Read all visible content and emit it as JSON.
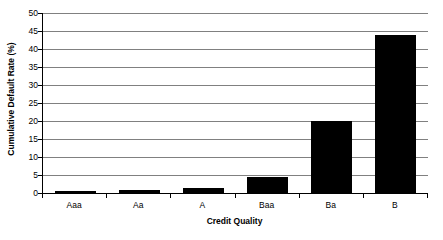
{
  "chart_data": {
    "type": "bar",
    "title": "",
    "categories": [
      "Aaa",
      "Aa",
      "A",
      "Baa",
      "Ba",
      "B"
    ],
    "values": [
      0.5,
      0.8,
      1.3,
      4.5,
      20.0,
      43.8
    ],
    "xlabel": "Credit Quality",
    "ylabel": "Cumulative Default Rate (%)",
    "ylim": [
      0,
      50
    ],
    "ytick_step": 5,
    "yticks": [
      0,
      5,
      10,
      15,
      20,
      25,
      30,
      35,
      40,
      45,
      50
    ],
    "ytick_labels": [
      "0",
      "5",
      "10",
      "15",
      "20",
      "25",
      "30",
      "35",
      "40",
      "45",
      "50"
    ],
    "grid": true,
    "grid_axis": "y",
    "legend": false,
    "legend_position": "none",
    "bar_color": "#000000",
    "grid_color": "#808080",
    "background_color": "#ffffff",
    "axis_color": "#000000"
  }
}
